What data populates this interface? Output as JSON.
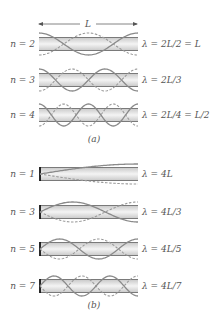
{
  "colors": {
    "tube_fill_edge": "#cfcfcf",
    "tube_fill_center": "#f2f2f2",
    "tube_wall": "#7a7a7a",
    "wave_solid": "#8a8a8a",
    "wave_dashed": "#9a9a9a",
    "closed_end": "#111111",
    "text": "#555555"
  },
  "part_a": {
    "caption": "(a)",
    "length_label": "L",
    "description": "Tube open at both ends",
    "tubes": [
      {
        "n_label": "n = 2",
        "n": 2,
        "equation": "λ = 2L/2 = L"
      },
      {
        "n_label": "n = 3",
        "n": 3,
        "equation": "λ = 2L/3"
      },
      {
        "n_label": "n = 4",
        "n": 4,
        "equation": "λ = 2L/4 = L/2"
      }
    ]
  },
  "part_b": {
    "caption": "(b)",
    "description": "Tube closed at one end",
    "tubes": [
      {
        "n_label": "n = 1",
        "n": 1,
        "equation": "λ = 4L"
      },
      {
        "n_label": "n = 3",
        "n": 3,
        "equation": "λ = 4L/3"
      },
      {
        "n_label": "n = 5",
        "n": 5,
        "equation": "λ = 4L/5"
      },
      {
        "n_label": "n = 7",
        "n": 7,
        "equation": "λ = 4L/7"
      }
    ]
  }
}
